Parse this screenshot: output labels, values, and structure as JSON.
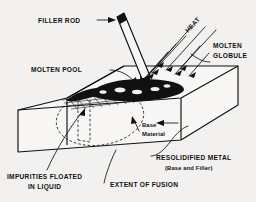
{
  "figure": {
    "background_color": "#f2f1ef",
    "ink_color": "#111111"
  },
  "labels": {
    "filler_rod": "FILLER ROD",
    "heat": "HEAT",
    "molten_globule_line1": "MOLTEN",
    "molten_globule_line2": "GLOBULE",
    "molten_pool": "MOLTEN POOL",
    "base_material_line1": "Base",
    "base_material_line2": "Material",
    "resolidified_metal": "RESOLIDIFIED METAL",
    "resolidified_metal_sub": "(Base and Filler)",
    "extent_of_fusion": "EXTENT OF FUSION",
    "impurities_line1": "IMPURITIES FLOATED",
    "impurities_line2": "IN LIQUID"
  }
}
